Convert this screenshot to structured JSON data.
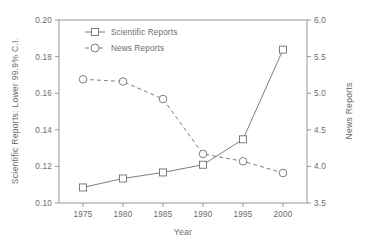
{
  "chart_data": {
    "type": "line",
    "title": "",
    "xlabel": "Year",
    "ylabel": "Scientific Reports: Lower 99.9% C.I.",
    "y2label": "News Reports",
    "x": [
      1975,
      1980,
      1985,
      1990,
      1995,
      2000
    ],
    "xtick_labels": [
      "1975",
      "1980",
      "1985",
      "1990",
      "1995",
      "2000"
    ],
    "xlim": [
      1972,
      2003
    ],
    "ylim": [
      0.1,
      0.2
    ],
    "ytick_labels": [
      "0.10",
      "0.12",
      "0.14",
      "0.16",
      "0.18",
      "0.20"
    ],
    "ytick_values": [
      0.1,
      0.12,
      0.14,
      0.16,
      0.18,
      0.2
    ],
    "y2lim": [
      3.5,
      6.0
    ],
    "y2tick_labels": [
      "3.5",
      "4.0",
      "4.5",
      "5.0",
      "5.5",
      "6.0"
    ],
    "y2tick_values": [
      3.5,
      4.0,
      4.5,
      5.0,
      5.5,
      6.0
    ],
    "grid": false,
    "legend_position": "top-left",
    "series": [
      {
        "name": "Scientific Reports",
        "axis": "left",
        "marker": "square",
        "linestyle": "solid",
        "color": "#6f6f6f",
        "values": [
          0.1085,
          0.1134,
          0.1167,
          0.1209,
          0.1348,
          0.1838
        ]
      },
      {
        "name": "News Reports",
        "axis": "right",
        "marker": "circle",
        "linestyle": "dashed",
        "color": "#6f6f6f",
        "values": [
          5.19,
          5.16,
          4.92,
          4.17,
          4.07,
          3.91
        ]
      }
    ]
  },
  "legend": {
    "items": [
      {
        "label": "Scientific Reports"
      },
      {
        "label": "News Reports"
      }
    ]
  },
  "axes": {
    "x_title": "Year",
    "y_left_title": "Scientific Reports: Lower 99.9% C.I.",
    "y_right_title": "News Reports"
  }
}
